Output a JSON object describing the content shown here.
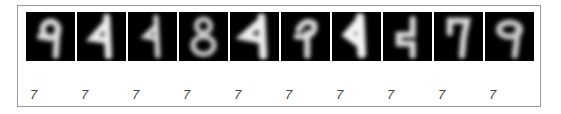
{
  "figure": {
    "images": [
      {
        "index": 0,
        "depicts": "digit resembling 9"
      },
      {
        "index": 1,
        "depicts": "digit resembling 4/1"
      },
      {
        "index": 2,
        "depicts": "digit resembling 1"
      },
      {
        "index": 3,
        "depicts": "digit resembling 8"
      },
      {
        "index": 4,
        "depicts": "digit resembling 4/1"
      },
      {
        "index": 5,
        "depicts": "digit resembling 9/4"
      },
      {
        "index": 6,
        "depicts": "digit resembling 4/1"
      },
      {
        "index": 7,
        "depicts": "digit resembling 4"
      },
      {
        "index": 8,
        "depicts": "digit resembling 7"
      },
      {
        "index": 9,
        "depicts": "digit resembling 9"
      }
    ],
    "labels": [
      "7",
      "7",
      "7",
      "7",
      "7",
      "7",
      "7",
      "7",
      "7",
      "7"
    ]
  }
}
